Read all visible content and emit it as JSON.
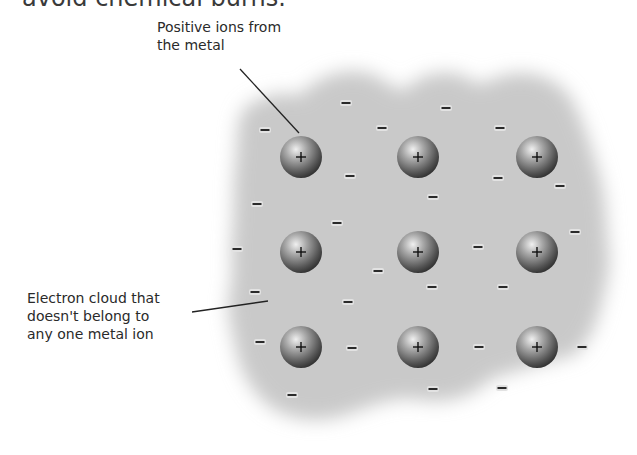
{
  "header": {
    "partial_text": "avoid chemical burns."
  },
  "labels": {
    "ions": {
      "lines": [
        "Positive ions from",
        "the metal"
      ]
    },
    "cloud": {
      "lines": [
        "Electron cloud that",
        "doesn't belong to",
        "any one metal ion"
      ]
    }
  },
  "ion_symbol": "+",
  "electron_symbol": "−",
  "ions": [
    {
      "x": 301,
      "y": 157
    },
    {
      "x": 418,
      "y": 157
    },
    {
      "x": 537,
      "y": 157
    },
    {
      "x": 301,
      "y": 252
    },
    {
      "x": 418,
      "y": 252
    },
    {
      "x": 537,
      "y": 252
    },
    {
      "x": 301,
      "y": 347
    },
    {
      "x": 418,
      "y": 347
    },
    {
      "x": 537,
      "y": 347
    }
  ],
  "electrons": [
    {
      "x": 346,
      "y": 103
    },
    {
      "x": 265,
      "y": 130
    },
    {
      "x": 382,
      "y": 128
    },
    {
      "x": 446,
      "y": 108
    },
    {
      "x": 500,
      "y": 128
    },
    {
      "x": 350,
      "y": 176
    },
    {
      "x": 433,
      "y": 197
    },
    {
      "x": 498,
      "y": 178
    },
    {
      "x": 560,
      "y": 186
    },
    {
      "x": 257,
      "y": 204
    },
    {
      "x": 337,
      "y": 223
    },
    {
      "x": 237,
      "y": 249
    },
    {
      "x": 378,
      "y": 271
    },
    {
      "x": 478,
      "y": 247
    },
    {
      "x": 575,
      "y": 232
    },
    {
      "x": 432,
      "y": 287
    },
    {
      "x": 503,
      "y": 287
    },
    {
      "x": 255,
      "y": 292
    },
    {
      "x": 348,
      "y": 302
    },
    {
      "x": 260,
      "y": 342
    },
    {
      "x": 352,
      "y": 348
    },
    {
      "x": 479,
      "y": 347
    },
    {
      "x": 582,
      "y": 347
    },
    {
      "x": 292,
      "y": 395
    },
    {
      "x": 433,
      "y": 389
    },
    {
      "x": 502,
      "y": 388
    }
  ],
  "colors": {
    "cloud": "#c8c8c8",
    "ion_light": "#e6e6e6",
    "ion_dark": "#3e3e3e",
    "leader_line": "#222222"
  }
}
